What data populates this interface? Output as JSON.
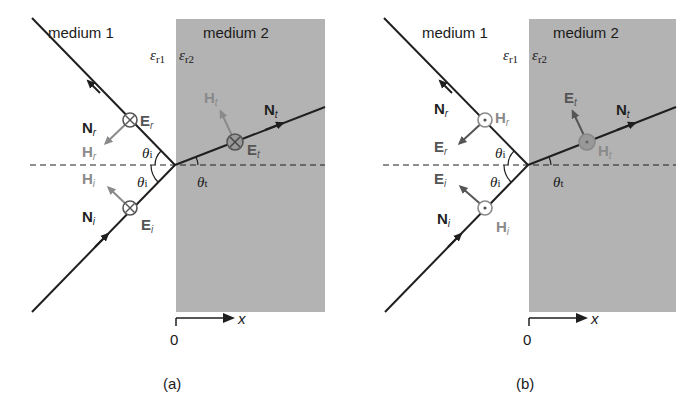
{
  "panels": [
    {
      "id": "a",
      "caption": "(a)",
      "medium1_label": "medium 1",
      "medium2_label": "medium 2",
      "eps1": "ε",
      "eps1_sub": "r1",
      "eps2": "ε",
      "eps2_sub": "r2",
      "theta": "θ",
      "theta_i_sub": "i",
      "theta_t_sub": "t",
      "axis_label": "x",
      "axis_origin": "0",
      "Nr": "N",
      "Nr_sub": "r",
      "Ni": "N",
      "Ni_sub": "i",
      "Nt": "N",
      "Nt_sub": "t",
      "Er": "E",
      "Er_sub": "r",
      "Ei": "E",
      "Ei_sub": "i",
      "Et": "E",
      "Et_sub": "t",
      "Hr": "H",
      "Hr_sub": "r",
      "Hi": "H",
      "Hi_sub": "i",
      "Ht": "H",
      "Ht_sub": "t",
      "polarization": "E into page (⊗), H in plane"
    },
    {
      "id": "b",
      "caption": "(b)",
      "medium1_label": "medium 1",
      "medium2_label": "medium 2",
      "eps1": "ε",
      "eps1_sub": "r1",
      "eps2": "ε",
      "eps2_sub": "r2",
      "theta": "θ",
      "theta_i_sub": "i",
      "theta_t_sub": "t",
      "axis_label": "x",
      "axis_origin": "0",
      "Nr": "N",
      "Nr_sub": "r",
      "Ni": "N",
      "Ni_sub": "i",
      "Nt": "N",
      "Nt_sub": "t",
      "Er": "E",
      "Er_sub": "r",
      "Ei": "E",
      "Ei_sub": "i",
      "Et": "E",
      "Et_sub": "t",
      "Hr": "H",
      "Hr_sub": "r",
      "Hi": "H",
      "Hi_sub": "i",
      "Ht": "H",
      "Ht_sub": "t",
      "polarization": "H out of page (⊙), E in plane"
    }
  ],
  "colors": {
    "medium2_fill": "#b3b3b3",
    "ray": "#1f1f1f",
    "field_gray": "#8a8a8a",
    "field_dark": "#555555"
  }
}
